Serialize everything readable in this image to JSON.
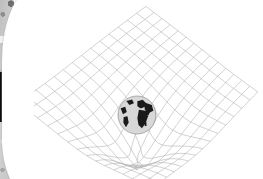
{
  "page": {
    "width": 263,
    "height": 179,
    "background_color": "#ffffff",
    "media_type": "scanned-book-page"
  },
  "scan_edge": {
    "label": "scanner-gutter-strip",
    "width": 14,
    "base_color": "#c9c9c9",
    "speckle_dark_color": "#6e6e6e",
    "speckle_light_color": "#f2f2f2",
    "dark_block": {
      "label": "black-gutter-block",
      "x": 0,
      "y": 72,
      "width": 10,
      "height": 50,
      "color": "#0a0a0a"
    },
    "page_edge_color": "#ffffff"
  },
  "figure": {
    "caption": "",
    "grid": {
      "label": "spacetime-grid",
      "line_color": "#b4b4b4",
      "line_width": 0.6,
      "divisions_u": 14,
      "divisions_v": 14,
      "apex_top": [
        146,
        4
      ],
      "apex_right": [
        259,
        86
      ],
      "apex_bottom": [
        152,
        183
      ],
      "apex_left": [
        16,
        96
      ],
      "well_depth": 52,
      "well_radius": 78
    },
    "body": {
      "label": "earth-globe",
      "center_x": 137,
      "center_y": 115,
      "radius": 19,
      "ocean_color": "#d8d8d8",
      "land_color": "#1a1a1a",
      "outline_color": "#9b9b9b",
      "continents": [
        "Europe",
        "Africa",
        "Asia",
        "South America"
      ]
    }
  },
  "chart_data": {
    "type": "scatter",
    "xlabel": "",
    "ylabel": "",
    "grid": true,
    "legend": "none",
    "series": [
      {
        "name": "deformed-grid-sheet",
        "description": "Rhombic mesh plane deformed into a gravity well",
        "nodes_u": 15,
        "nodes_v": 15
      },
      {
        "name": "earth",
        "description": "Massive body resting at the center of the well",
        "x": [
          137
        ],
        "y": [
          115
        ],
        "size": [
          38
        ]
      }
    ]
  }
}
